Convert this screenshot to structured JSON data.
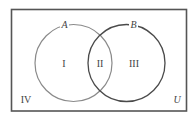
{
  "diagram": {
    "type": "venn",
    "universe_label": "U",
    "sets": [
      {
        "label": "A",
        "stroke": "#8a8a8a"
      },
      {
        "label": "B",
        "stroke": "#4a4a4a"
      }
    ],
    "regions": {
      "only_a": "I",
      "a_and_b": "II",
      "only_b": "III",
      "outside": "IV"
    },
    "colors": {
      "border": "#555555",
      "background": "#ffffff",
      "text": "#444444"
    }
  }
}
